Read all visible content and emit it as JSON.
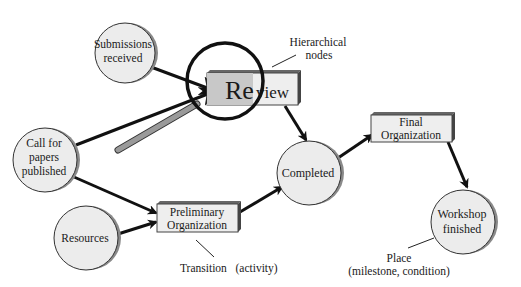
{
  "diagram": {
    "type": "petri-net-workflow",
    "colors": {
      "place_fill": "#ececec",
      "place_shadow": "#8a8a8a",
      "transition_fill": "#eeeeee",
      "transition_highlight_fill": "#c8c8c8",
      "transition_side": "#555555",
      "arrow": "#111111",
      "magnifier_handle": "#9a9a9a"
    },
    "places": [
      {
        "id": "submissions",
        "lines": [
          "Submissions",
          "received"
        ]
      },
      {
        "id": "call",
        "lines": [
          "Call for",
          "papers",
          "published"
        ]
      },
      {
        "id": "resources",
        "lines": [
          "Resources"
        ]
      },
      {
        "id": "completed",
        "lines": [
          "Completed"
        ]
      },
      {
        "id": "workshop",
        "lines": [
          "Workshop",
          "finished"
        ]
      }
    ],
    "transitions": [
      {
        "id": "review",
        "label_magnified": "Re",
        "label_rest": "view"
      },
      {
        "id": "prelim",
        "lines": [
          "Preliminary",
          "Organization"
        ]
      },
      {
        "id": "final",
        "lines": [
          "Final",
          "Organization"
        ]
      }
    ],
    "annotations": {
      "hierarchical": [
        "Hierarchical",
        "nodes"
      ],
      "transition": "Transition   (activity)",
      "place": [
        "Place",
        "(milestone, condition)"
      ]
    }
  }
}
